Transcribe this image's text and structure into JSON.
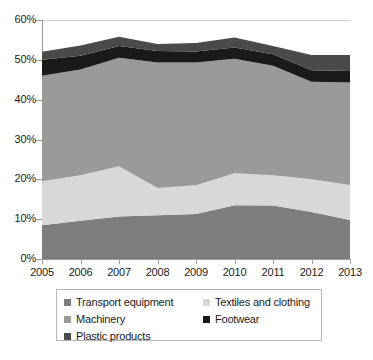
{
  "chart_data": {
    "type": "area",
    "stacked": true,
    "title": "",
    "xlabel": "",
    "ylabel": "",
    "x": [
      2005,
      2006,
      2007,
      2008,
      2009,
      2010,
      2011,
      2012,
      2013
    ],
    "xtick_labels": [
      "2005",
      "2006",
      "2007",
      "2008",
      "2009",
      "2010",
      "2011",
      "2012",
      "2013"
    ],
    "ytick_labels": [
      "0%",
      "10%",
      "20%",
      "30%",
      "40%",
      "50%",
      "60%"
    ],
    "ytick_values": [
      0,
      10,
      20,
      30,
      40,
      50,
      60
    ],
    "ylim": [
      0,
      60
    ],
    "xlim": [
      2005,
      2013
    ],
    "grid": false,
    "legend_position": "bottom",
    "series": [
      {
        "name": "Transport equipment",
        "color": "#7d7d7d",
        "values": [
          8.5,
          9.6,
          10.7,
          11.0,
          11.3,
          13.5,
          13.4,
          11.8,
          9.8
        ]
      },
      {
        "name": "Textiles and clothing",
        "color": "#d8d8d8",
        "values": [
          11.0,
          11.4,
          12.6,
          6.8,
          7.2,
          8.0,
          7.6,
          8.2,
          8.8
        ]
      },
      {
        "name": "Machinery",
        "color": "#9a9a9a",
        "values": [
          26.5,
          26.6,
          27.2,
          31.5,
          30.8,
          28.8,
          27.5,
          24.5,
          25.7
        ]
      },
      {
        "name": "Footwear",
        "color": "#1a1a1a",
        "values": [
          4.0,
          3.4,
          3.0,
          2.9,
          2.8,
          2.8,
          2.9,
          2.9,
          2.9
        ]
      },
      {
        "name": "Plastic products",
        "color": "#4a4a4a",
        "values": [
          2.0,
          2.6,
          2.3,
          1.8,
          2.1,
          2.5,
          2.1,
          3.8,
          4.0
        ]
      }
    ],
    "cumulative_tops": {
      "transport_equipment": [
        8.5,
        9.6,
        10.7,
        11.0,
        11.3,
        13.5,
        13.4,
        11.8,
        9.8
      ],
      "textiles_and_clothing": [
        19.5,
        21.0,
        23.3,
        17.8,
        18.5,
        21.5,
        21.0,
        20.0,
        18.6
      ],
      "machinery": [
        46.0,
        47.6,
        50.5,
        49.3,
        49.3,
        50.3,
        48.5,
        44.5,
        44.3
      ],
      "footwear": [
        50.0,
        51.0,
        53.5,
        52.2,
        52.1,
        53.1,
        51.4,
        47.4,
        47.2
      ],
      "plastic_products": [
        52.0,
        53.6,
        55.8,
        54.0,
        54.2,
        55.6,
        53.5,
        51.2,
        51.2
      ]
    }
  },
  "legend": {
    "column_1": [
      {
        "label": "Transport equipment",
        "color": "#7d7d7d"
      },
      {
        "label": "Machinery",
        "color": "#9a9a9a"
      },
      {
        "label": "Plastic products",
        "color": "#4a4a4a"
      }
    ],
    "column_2": [
      {
        "label": "Textiles and clothing",
        "color": "#d8d8d8"
      },
      {
        "label": "Footwear",
        "color": "#1a1a1a"
      }
    ]
  }
}
